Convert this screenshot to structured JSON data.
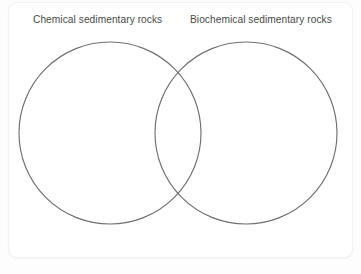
{
  "diagram": {
    "type": "venn",
    "title": "",
    "background_color": "#fdfdfd",
    "card_color": "#ffffff",
    "stroke_color": "#6f6f6f",
    "label_color": "#4a4a4a",
    "sets": [
      {
        "id": "left",
        "label": "Chemical sedimentary rocks",
        "cx": 110,
        "cy": 133,
        "r": 91,
        "items": []
      },
      {
        "id": "right",
        "label": "Biochemical sedimentary rocks",
        "cx": 246,
        "cy": 133,
        "r": 91,
        "items": []
      }
    ],
    "intersection": {
      "label": "",
      "items": []
    }
  }
}
